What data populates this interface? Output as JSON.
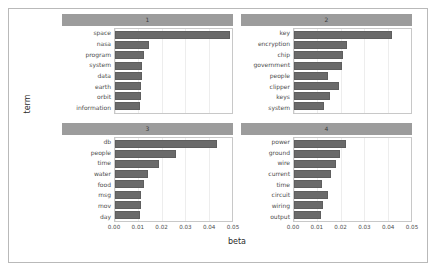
{
  "chart_data": {
    "type": "bar",
    "orientation": "horizontal",
    "title": "",
    "xlabel": "beta",
    "ylabel": "term",
    "xlim": [
      0,
      0.05
    ],
    "xticks": [
      "0.00",
      "0.01",
      "0.02",
      "0.03",
      "0.04",
      "0.05"
    ],
    "xtick_values": [
      0.0,
      0.01,
      0.02,
      0.03,
      0.04,
      0.05
    ],
    "grid": true,
    "legend": "none",
    "facet_layout": "2x2",
    "bar_color": "#6a6a6a",
    "strip_color": "#9c9c9c",
    "panels": [
      {
        "label": "1",
        "categories": [
          "space",
          "nasa",
          "program",
          "system",
          "data",
          "earth",
          "orbit",
          "information"
        ],
        "values": [
          0.049,
          0.0145,
          0.0126,
          0.0116,
          0.0114,
          0.0112,
          0.011,
          0.0108
        ]
      },
      {
        "label": "2",
        "categories": [
          "key",
          "encryption",
          "chip",
          "government",
          "people",
          "clipper",
          "keys",
          "system"
        ],
        "values": [
          0.042,
          0.0226,
          0.0211,
          0.0205,
          0.0146,
          0.0192,
          0.0152,
          0.0128
        ]
      },
      {
        "label": "3",
        "categories": [
          "db",
          "people",
          "time",
          "water",
          "food",
          "msg",
          "mov",
          "day"
        ],
        "values": [
          0.0435,
          0.0262,
          0.019,
          0.0142,
          0.0122,
          0.0112,
          0.0112,
          0.0108
        ]
      },
      {
        "label": "4",
        "categories": [
          "power",
          "ground",
          "wire",
          "current",
          "time",
          "circuit",
          "wiring",
          "output"
        ],
        "values": [
          0.0221,
          0.0197,
          0.0178,
          0.016,
          0.0118,
          0.0145,
          0.0122,
          0.0115
        ]
      }
    ]
  }
}
